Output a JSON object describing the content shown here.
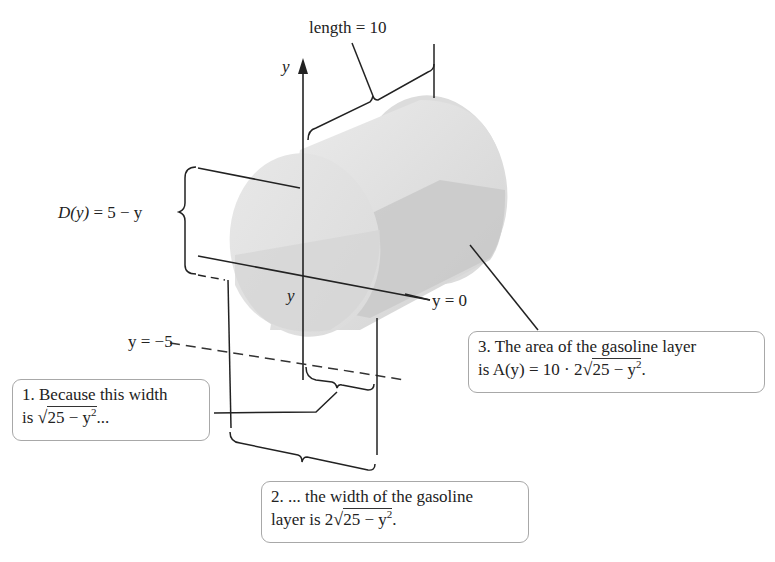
{
  "diagram": {
    "title_label": "length = 10",
    "depth_label": {
      "prefix": "D(y)",
      "rest": " = 5 − y"
    },
    "axis_label_y": "y",
    "inner_y_label": "y",
    "y0_label": "y = 0",
    "ym5_label": "y = −5",
    "callouts": [
      {
        "id": 1,
        "line1": "1. Because this width",
        "line2_prefix": "is ",
        "line2_sqrt": "√",
        "line2_radicand": "25 − y",
        "line2_exp": "2",
        "line2_suffix": "..."
      },
      {
        "id": 2,
        "line1": "2. ... the width of the gasoline",
        "line2_prefix": "layer is 2",
        "line2_sqrt": "√",
        "line2_radicand": "25 − y",
        "line2_exp": "2",
        "line2_suffix": "."
      },
      {
        "id": 3,
        "line1": "3. The area of the gasoline layer",
        "line2_prefix": "is A(y) = 10 · 2",
        "line2_sqrt": "√",
        "line2_radicand": "25 − y",
        "line2_exp": "2",
        "line2_suffix": "."
      }
    ],
    "colors": {
      "cylinder_light": "#e2e2e2",
      "cylinder_mid": "#d0d0d0",
      "gasoline_layer": "#c4c4c4",
      "ink": "#222222",
      "box_border": "#a8a8a8"
    }
  }
}
